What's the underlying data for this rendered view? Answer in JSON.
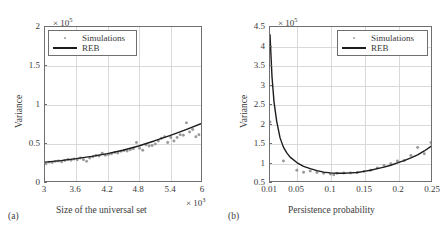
{
  "figure": {
    "panels": [
      {
        "id": "a",
        "caption": "(a)",
        "xlabel": "Size of the universal set",
        "ylabel": "Variance",
        "x_exponent": "× 10",
        "x_exponent_sup": "3",
        "y_exponent": "× 10",
        "y_exponent_sup": "5",
        "legend": [
          {
            "label": "Simulations",
            "marker": "dot",
            "color": "#9a9a9a"
          },
          {
            "label": "REB",
            "marker": "line",
            "color": "#1c1c1c"
          }
        ],
        "xticks": [
          "3",
          "3.6",
          "4.2",
          "4.8",
          "5.4",
          "6"
        ],
        "yticks": [
          "0",
          "0.5",
          "1",
          "1.5",
          "2"
        ]
      },
      {
        "id": "b",
        "caption": "(b)",
        "xlabel": "Persistence probability",
        "ylabel": "Variance",
        "x_exponent": "",
        "x_exponent_sup": "",
        "y_exponent": "× 10",
        "y_exponent_sup": "5",
        "legend": [
          {
            "label": "Simulations",
            "marker": "dot",
            "color": "#9a9a9a"
          },
          {
            "label": "REB",
            "marker": "line",
            "color": "#1c1c1c"
          }
        ],
        "xticks": [
          "0.01",
          "0.05",
          "0.1",
          "0.15",
          "0.2",
          "0.25"
        ],
        "yticks": [
          "0.5",
          "1",
          "1.5",
          "2",
          "2.5",
          "3",
          "3.5",
          "4",
          "4.5"
        ]
      }
    ]
  },
  "chart_data": [
    {
      "type": "scatter",
      "panel": "a",
      "title": "",
      "xlabel": "Size of the universal set",
      "ylabel": "Variance",
      "x_scale_note": "x values in units of 10^3",
      "y_scale_note": "y values in units of 10^5",
      "xlim": [
        3,
        6
      ],
      "ylim": [
        0,
        2
      ],
      "grid": true,
      "legend_position": "top-left",
      "series": [
        {
          "name": "Simulations",
          "marker": "dot",
          "color": "#9a9a9a",
          "x": [
            3.02,
            3.08,
            3.14,
            3.2,
            3.26,
            3.32,
            3.38,
            3.44,
            3.5,
            3.56,
            3.62,
            3.68,
            3.74,
            3.8,
            3.86,
            3.92,
            3.98,
            4.04,
            4.1,
            4.16,
            4.22,
            4.28,
            4.34,
            4.4,
            4.46,
            4.52,
            4.58,
            4.64,
            4.7,
            4.76,
            4.82,
            4.88,
            4.94,
            5.0,
            5.06,
            5.12,
            5.18,
            5.24,
            5.3,
            5.36,
            5.42,
            5.48,
            5.54,
            5.6,
            5.66,
            5.72,
            5.78,
            5.84,
            5.9,
            5.96
          ],
          "y": [
            0.225,
            0.245,
            0.24,
            0.255,
            0.26,
            0.25,
            0.265,
            0.28,
            0.27,
            0.285,
            0.275,
            0.3,
            0.275,
            0.255,
            0.3,
            0.315,
            0.33,
            0.325,
            0.36,
            0.335,
            0.345,
            0.355,
            0.37,
            0.365,
            0.385,
            0.395,
            0.39,
            0.405,
            0.42,
            0.5,
            0.425,
            0.4,
            0.47,
            0.455,
            0.46,
            0.48,
            0.52,
            0.555,
            0.575,
            0.5,
            0.565,
            0.52,
            0.565,
            0.6,
            0.595,
            0.755,
            0.635,
            0.67,
            0.575,
            0.6
          ]
        },
        {
          "name": "REB",
          "marker": "line",
          "color": "#1c1c1c",
          "x": [
            3.0,
            3.3,
            3.6,
            3.9,
            4.2,
            4.5,
            4.8,
            5.1,
            5.4,
            5.7,
            6.0
          ],
          "y": [
            0.245,
            0.265,
            0.29,
            0.32,
            0.355,
            0.4,
            0.455,
            0.52,
            0.59,
            0.665,
            0.745
          ]
        }
      ]
    },
    {
      "type": "scatter",
      "panel": "b",
      "title": "",
      "xlabel": "Persistence probability",
      "ylabel": "Variance",
      "x_scale_note": "x values are raw probabilities",
      "y_scale_note": "y values in units of 10^5",
      "xlim": [
        0.01,
        0.25
      ],
      "ylim": [
        0.5,
        4.5
      ],
      "grid": true,
      "legend_position": "top-right",
      "series": [
        {
          "name": "Simulations",
          "marker": "dot",
          "color": "#9a9a9a",
          "x": [
            0.01,
            0.03,
            0.05,
            0.06,
            0.07,
            0.08,
            0.09,
            0.1,
            0.105,
            0.11,
            0.12,
            0.13,
            0.14,
            0.15,
            0.16,
            0.17,
            0.18,
            0.19,
            0.2,
            0.21,
            0.22,
            0.23,
            0.24,
            0.25
          ],
          "y": [
            2.03,
            1.02,
            0.78,
            0.73,
            0.76,
            0.72,
            0.7,
            0.68,
            0.66,
            0.7,
            0.71,
            0.71,
            0.72,
            0.75,
            0.78,
            0.84,
            0.9,
            0.95,
            1.02,
            1.03,
            1.16,
            1.37,
            1.21,
            1.5
          ]
        },
        {
          "name": "REB",
          "marker": "line",
          "color": "#1c1c1c",
          "x": [
            0.01,
            0.013,
            0.016,
            0.02,
            0.025,
            0.03,
            0.035,
            0.04,
            0.05,
            0.06,
            0.07,
            0.08,
            0.09,
            0.1,
            0.11,
            0.12,
            0.13,
            0.14,
            0.15,
            0.16,
            0.17,
            0.18,
            0.19,
            0.2,
            0.21,
            0.22,
            0.23,
            0.24,
            0.25
          ],
          "y": [
            4.3,
            3.2,
            2.55,
            2.05,
            1.62,
            1.38,
            1.23,
            1.12,
            0.98,
            0.88,
            0.82,
            0.77,
            0.73,
            0.71,
            0.7,
            0.7,
            0.71,
            0.72,
            0.75,
            0.78,
            0.82,
            0.86,
            0.91,
            0.97,
            1.03,
            1.1,
            1.18,
            1.28,
            1.4
          ]
        }
      ]
    }
  ]
}
